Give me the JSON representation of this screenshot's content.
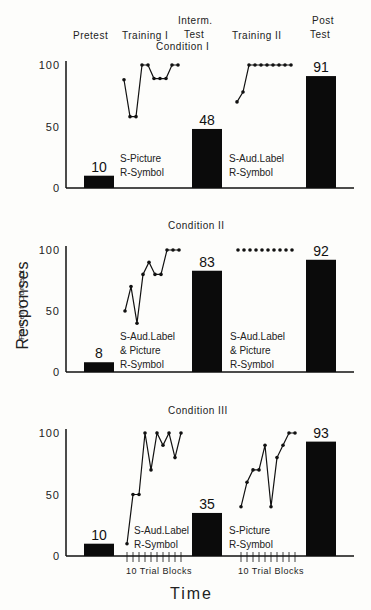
{
  "chart_data": [
    {
      "type": "bar+line",
      "title": "Condition I",
      "phases": [
        "Pretest",
        "Training I",
        "Interm. Test",
        "Training II",
        "Post Test"
      ],
      "bars": {
        "categories": [
          "Pretest",
          "Interm. Test",
          "Post Test"
        ],
        "values": [
          10,
          48,
          91
        ]
      },
      "training_I": {
        "label": [
          "S-Picture",
          "R-Symbol"
        ],
        "values": [
          88,
          58,
          58,
          100,
          100,
          89,
          89,
          89,
          100,
          100
        ]
      },
      "training_II": {
        "label": [
          "S-Aud.Label",
          "R-Symbol"
        ],
        "values": [
          70,
          78,
          100,
          100,
          100,
          100,
          100,
          100,
          100,
          100
        ]
      },
      "ylim": [
        0,
        100
      ],
      "yticks": [
        "0",
        "50",
        "100"
      ]
    },
    {
      "type": "bar+line",
      "title": "Condition II",
      "bars": {
        "categories": [
          "Pretest",
          "Interm. Test",
          "Post Test"
        ],
        "values": [
          8,
          83,
          92
        ]
      },
      "training_I": {
        "label": [
          "S-Aud.Label",
          "& Picture",
          "R-Symbol"
        ],
        "values": [
          50,
          70,
          40,
          80,
          90,
          80,
          80,
          100,
          100,
          100
        ]
      },
      "training_II": {
        "label": [
          "S-Aud.Label",
          "& Picture",
          "R-Symbol"
        ],
        "values": [
          100,
          100,
          100,
          100,
          100,
          100,
          100,
          100,
          100,
          100
        ]
      },
      "ylim": [
        0,
        100
      ],
      "yticks": [
        "0",
        "50",
        "100"
      ]
    },
    {
      "type": "bar+line",
      "title": "Condition III",
      "bars": {
        "categories": [
          "Pretest",
          "Interm. Test",
          "Post Test"
        ],
        "values": [
          10,
          35,
          93
        ]
      },
      "training_I": {
        "label": [
          "S-Aud.Label",
          "R-Symbol"
        ],
        "values": [
          10,
          50,
          50,
          100,
          70,
          100,
          90,
          100,
          80,
          100
        ]
      },
      "training_II": {
        "label": [
          "S-Picture",
          "R-Symbol"
        ],
        "values": [
          40,
          60,
          70,
          70,
          90,
          40,
          80,
          90,
          100,
          100
        ]
      },
      "ylim": [
        0,
        100
      ],
      "yticks": [
        "0",
        "50",
        "100"
      ]
    }
  ],
  "header": {
    "pretest": "Pretest",
    "training1": "Training I",
    "interm1": "Interm.",
    "interm2": "Test",
    "training2": "Training II",
    "post1": "Post",
    "post2": "Test"
  },
  "ylabel": {
    "main": "Responses",
    "sub": "Percent   Correct"
  },
  "xlabel": "Time",
  "trial_blocks_label": "10 Trial Blocks"
}
